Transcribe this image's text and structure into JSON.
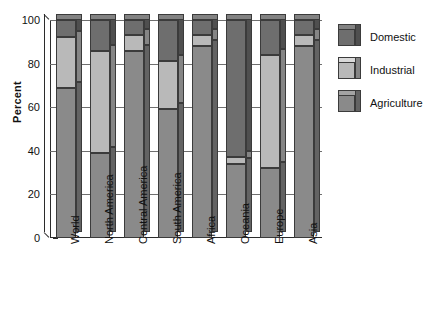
{
  "chart_data": {
    "type": "bar",
    "subtype": "stacked-percentage-3d",
    "title": "",
    "xlabel": "",
    "ylabel": "Percent",
    "ylim": [
      0,
      100
    ],
    "yticks": [
      0,
      20,
      40,
      60,
      80,
      100
    ],
    "ytick_labels": [
      "0",
      "20",
      "40",
      "60",
      "80",
      "100"
    ],
    "grid": true,
    "legend_position": "right",
    "categories": [
      "World",
      "North America",
      "Central America",
      "South America",
      "Africa",
      "Oceania",
      "Europe",
      "Asia"
    ],
    "series": [
      {
        "name": "Agriculture",
        "color": "#8a8a8a",
        "values": [
          69,
          39,
          86,
          59,
          88,
          34,
          32,
          88
        ]
      },
      {
        "name": "Industrial",
        "color": "#b9b9b9",
        "values": [
          23,
          47,
          7,
          22,
          5,
          3,
          52,
          5
        ]
      },
      {
        "name": "Domestic",
        "color": "#6e6e6e",
        "values": [
          8,
          14,
          7,
          19,
          7,
          63,
          16,
          7
        ]
      }
    ],
    "cumulative_tops": {
      "Agriculture": [
        69,
        39,
        86,
        59,
        88,
        34,
        32,
        88
      ],
      "Industrial": [
        92,
        86,
        93,
        81,
        93,
        37,
        84,
        93
      ],
      "Domestic": [
        100,
        100,
        100,
        100,
        100,
        100,
        100,
        100
      ]
    }
  },
  "axis": {
    "y_title": "Percent"
  },
  "legend": {
    "entries": [
      {
        "label": "Domestic",
        "color": "#6e6e6e"
      },
      {
        "label": "Industrial",
        "color": "#b9b9b9"
      },
      {
        "label": "Agriculture",
        "color": "#8a8a8a"
      }
    ]
  },
  "colors": {
    "domestic": "#6e6e6e",
    "industrial": "#b9b9b9",
    "agriculture": "#8a8a8a",
    "outline": "#3b3b3b",
    "gridline": "#6f6f6f",
    "axis": "#2b2b2b",
    "background": "#ffffff"
  }
}
